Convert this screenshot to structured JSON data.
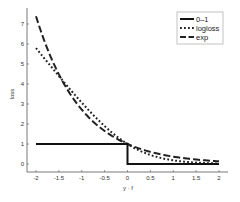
{
  "chart_data": {
    "type": "line",
    "title": "",
    "xlabel": "y · f",
    "ylabel": "loss",
    "xlim": [
      -2,
      2
    ],
    "ylim": [
      -0.4,
      7.8
    ],
    "xticks": [
      -2,
      -1.5,
      -1,
      -0.5,
      0,
      0.5,
      1,
      1.5,
      2
    ],
    "xtick_labels": [
      "-2",
      "-1.5",
      "-1",
      "-0.5",
      "0",
      "0.5",
      "1",
      "1.5",
      "2"
    ],
    "yticks": [
      0,
      1,
      2,
      3,
      4,
      5,
      6,
      7
    ],
    "ytick_labels": [
      "0",
      "1",
      "2",
      "3",
      "4",
      "5",
      "6",
      "7"
    ],
    "grid": false,
    "legend_position": "upper right",
    "x": [
      -2,
      -1.5,
      -1,
      -0.5,
      0,
      0.5,
      1,
      1.5,
      2
    ],
    "series": [
      {
        "name": "0–1",
        "style": "solid",
        "values": [
          1,
          1,
          1,
          1,
          1,
          0,
          0,
          0,
          0
        ]
      },
      {
        "name": "logloss",
        "style": "dotted",
        "values": [
          5.8,
          4.4,
          3.05,
          1.89,
          1.0,
          0.45,
          0.18,
          0.07,
          0.03
        ]
      },
      {
        "name": "exp",
        "style": "dashed",
        "values": [
          7.39,
          4.48,
          2.72,
          1.65,
          1.0,
          0.61,
          0.37,
          0.22,
          0.14
        ]
      }
    ]
  }
}
